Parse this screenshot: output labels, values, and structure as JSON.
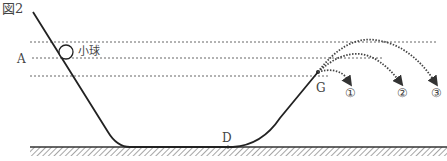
{
  "figure": {
    "title": "図2",
    "labels": {
      "ball": "小球",
      "point_a": "A",
      "point_d": "D",
      "point_g": "G",
      "path_1": "①",
      "path_2": "②",
      "path_3": "③"
    },
    "colors": {
      "line": "#222222",
      "dotted": "#555555",
      "ground_hatch": "#777777"
    }
  }
}
